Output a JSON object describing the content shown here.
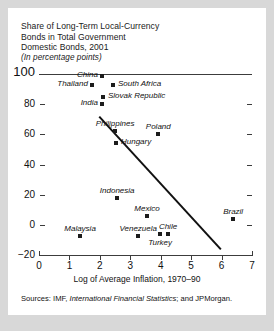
{
  "title": {
    "line1": "Share of Long-Term Local-Currency",
    "line2": "Bonds in Total Government",
    "line3": "Domestic Bonds, 2001",
    "units": "(In percentage points)"
  },
  "sources": {
    "prefix": "Sources: IMF, ",
    "italic": "International Financial Statistics",
    "suffix": "; and JPMorgan."
  },
  "chart_data": {
    "type": "scatter",
    "title": "Share of Long-Term Local-Currency Bonds in Total Government Domestic Bonds, 2001",
    "subtitle": "(In percentage points)",
    "xlabel": "Log of Average Inflation, 1970–90",
    "ylabel": "",
    "xlim": [
      0,
      7
    ],
    "ylim": [
      -20,
      100
    ],
    "xticks": [
      "0",
      "1",
      "2",
      "3",
      "4",
      "5",
      "6",
      "7"
    ],
    "yticks": [
      "100",
      "80",
      "60",
      "40",
      "20",
      "0",
      "−20"
    ],
    "grid": false,
    "legend": "none",
    "points": [
      {
        "label": "China",
        "x": 2.07,
        "y": 99,
        "label_pos": "left"
      },
      {
        "label": "South Africa",
        "x": 2.43,
        "y": 93,
        "label_pos": "right"
      },
      {
        "label": "Thailand",
        "x": 1.74,
        "y": 93,
        "label_pos": "left"
      },
      {
        "label": "Slovak Republic",
        "x": 2.1,
        "y": 85,
        "label_pos": "right"
      },
      {
        "label": "India",
        "x": 2.07,
        "y": 80,
        "label_pos": "left"
      },
      {
        "label": "Philippines",
        "x": 2.5,
        "y": 62,
        "label_pos": "above"
      },
      {
        "label": "Poland",
        "x": 3.92,
        "y": 60,
        "label_pos": "above"
      },
      {
        "label": "Hungary",
        "x": 2.53,
        "y": 54,
        "label_pos": "right"
      },
      {
        "label": "Indonesia",
        "x": 2.57,
        "y": 18,
        "label_pos": "above"
      },
      {
        "label": "Mexico",
        "x": 3.55,
        "y": 6,
        "label_pos": "above"
      },
      {
        "label": "Brazil",
        "x": 6.38,
        "y": 4,
        "label_pos": "above"
      },
      {
        "label": "Malaysia",
        "x": 1.35,
        "y": -7,
        "label_pos": "above"
      },
      {
        "label": "Venezuela",
        "x": 3.26,
        "y": -7,
        "label_pos": "above"
      },
      {
        "label": "Turkey",
        "x": 3.98,
        "y": -6,
        "label_pos": "below"
      },
      {
        "label": "Chile",
        "x": 4.24,
        "y": -6,
        "label_pos": "above"
      }
    ],
    "trendline": {
      "x0": 2.0,
      "y0": 72,
      "x1": 6.0,
      "y1": -16
    }
  }
}
